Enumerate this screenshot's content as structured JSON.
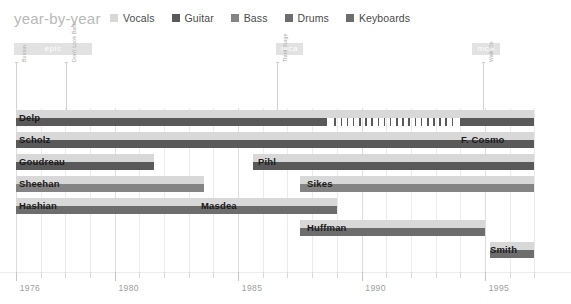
{
  "header": {
    "title": "year-by-year",
    "legend": [
      {
        "label": "Vocals",
        "color": "#d8d8d8"
      },
      {
        "label": "Guitar",
        "color": "#595959"
      },
      {
        "label": "Bass",
        "color": "#848484"
      },
      {
        "label": "Drums",
        "color": "#6d6d6d"
      },
      {
        "label": "Keyboards",
        "color": "#6d6d6d"
      }
    ]
  },
  "labels": {
    "colors": {
      "vocals": "#d8d8d8",
      "guitar": "#595959",
      "bass": "#848484",
      "drums": "#6d6d6d",
      "keyboards": "#6d6d6d",
      "grid": "#eceaea",
      "ribbon": "#e2e2e2",
      "axis_text": "#9d9d9d",
      "title": "#b9b9b9"
    }
  },
  "ribbons": [
    {
      "text": "epic",
      "x": 14,
      "w": 78
    },
    {
      "text": "mca",
      "x": 276,
      "w": 27
    },
    {
      "text": "mca",
      "x": 472,
      "w": 28
    }
  ],
  "albums": [
    {
      "name": "Boston",
      "x": 16
    },
    {
      "name": "Don't Look Back",
      "x": 66
    },
    {
      "name": "Third Stage",
      "x": 277
    },
    {
      "name": "Walk On",
      "x": 483
    }
  ],
  "chart_data": {
    "type": "bar",
    "title": "year-by-year",
    "xlabel": "",
    "ylabel": "",
    "xlim": [
      1976,
      1997
    ],
    "grid": true,
    "legend_position": "top",
    "tick_years": [
      1976,
      1977,
      1978,
      1979,
      1980,
      1981,
      1982,
      1983,
      1984,
      1985,
      1986,
      1987,
      1988,
      1989,
      1990,
      1991,
      1992,
      1993,
      1994,
      1995,
      1996,
      1997
    ],
    "labeled_years": [
      1976,
      1980,
      1985,
      1990,
      1995
    ],
    "members": [
      {
        "name": "Delp",
        "row": 0,
        "label_x": 14,
        "segments": [
          {
            "role": "vocals",
            "start": 1976.0,
            "end": 1997.0,
            "layer": "top"
          },
          {
            "role": "guitar",
            "start": 1976.0,
            "end": 1988.6,
            "layer": "bottom"
          },
          {
            "role": "guitar",
            "start": 1994.0,
            "end": 1997.0,
            "layer": "bottom"
          }
        ],
        "dashed": {
          "role": "guitar",
          "start": 1988.9,
          "end": 1993.9,
          "count": 20,
          "layer": "bottom"
        }
      },
      {
        "name": "Scholz",
        "row": 1,
        "label_x": 14,
        "segments": [
          {
            "role": "vocals",
            "start": 1976.0,
            "end": 1997.0,
            "layer": "top"
          },
          {
            "role": "guitar",
            "start": 1976.0,
            "end": 1997.0,
            "layer": "bottom"
          }
        ]
      },
      {
        "name": "F. Cosmo",
        "row": 1,
        "label_x": 456,
        "segments": [
          {
            "role": "vocals",
            "start": 1993.6,
            "end": 1997.0,
            "layer": "top"
          },
          {
            "role": "guitar",
            "start": 1993.6,
            "end": 1997.0,
            "layer": "bottom"
          }
        ]
      },
      {
        "name": "Goudreau",
        "row": 2,
        "label_x": 14,
        "segments": [
          {
            "role": "vocals",
            "start": 1976.0,
            "end": 1981.6,
            "layer": "top"
          },
          {
            "role": "guitar",
            "start": 1976.0,
            "end": 1981.6,
            "layer": "bottom"
          }
        ]
      },
      {
        "name": "Pihl",
        "row": 2,
        "label_x": 253,
        "segments": [
          {
            "role": "vocals",
            "start": 1985.6,
            "end": 1997.0,
            "layer": "top"
          },
          {
            "role": "guitar",
            "start": 1985.6,
            "end": 1997.0,
            "layer": "bottom"
          }
        ]
      },
      {
        "name": "Sheehan",
        "row": 3,
        "label_x": 14,
        "segments": [
          {
            "role": "vocals",
            "start": 1976.0,
            "end": 1983.6,
            "layer": "top"
          },
          {
            "role": "bass",
            "start": 1976.0,
            "end": 1983.6,
            "layer": "bottom"
          }
        ]
      },
      {
        "name": "Sikes",
        "row": 3,
        "label_x": 302,
        "segments": [
          {
            "role": "vocals",
            "start": 1987.5,
            "end": 1997.0,
            "layer": "top"
          },
          {
            "role": "bass",
            "start": 1987.5,
            "end": 1997.0,
            "layer": "bottom"
          }
        ]
      },
      {
        "name": "Hashian",
        "row": 4,
        "label_x": 14,
        "segments": [
          {
            "role": "vocals",
            "start": 1976.0,
            "end": 1983.8,
            "layer": "top"
          },
          {
            "role": "drums",
            "start": 1976.0,
            "end": 1983.8,
            "layer": "bottom"
          }
        ]
      },
      {
        "name": "Masdea",
        "row": 4,
        "label_x": 196,
        "segments": [
          {
            "role": "vocals",
            "start": 1983.3,
            "end": 1989.0,
            "layer": "top"
          },
          {
            "role": "drums",
            "start": 1983.3,
            "end": 1989.0,
            "layer": "bottom"
          }
        ]
      },
      {
        "name": "Huffman",
        "row": 5,
        "label_x": 302,
        "segments": [
          {
            "role": "vocals",
            "start": 1987.5,
            "end": 1995.0,
            "layer": "top"
          },
          {
            "role": "keyboards",
            "start": 1987.5,
            "end": 1995.0,
            "layer": "bottom"
          }
        ]
      },
      {
        "name": "Smith",
        "row": 6,
        "label_x": 485,
        "segments": [
          {
            "role": "vocals",
            "start": 1995.2,
            "end": 1997.0,
            "layer": "top"
          },
          {
            "role": "keyboards",
            "start": 1995.2,
            "end": 1997.0,
            "layer": "bottom"
          }
        ]
      }
    ]
  }
}
